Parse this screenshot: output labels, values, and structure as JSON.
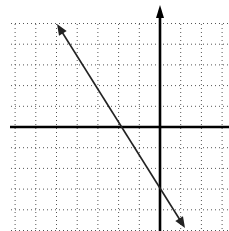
{
  "chart_data": {
    "type": "line",
    "title": "",
    "xlabel": "",
    "ylabel": "",
    "grid": true,
    "grid_style": "dotted",
    "xlim": [
      -7,
      3
    ],
    "ylim": [
      -5,
      5
    ],
    "grid_step": 1,
    "axes_arrows": {
      "y_positive": true,
      "x_positive": false
    },
    "series": [
      {
        "name": "line",
        "equation": "y = -1.5x - 3",
        "slope": -1.5,
        "intercept": -3,
        "x": [
          -5,
          -4,
          -2,
          0,
          1.2
        ],
        "y": [
          4.5,
          3,
          0,
          -3,
          -4.8
        ],
        "arrows": "both",
        "color": "#222222"
      }
    ]
  },
  "layout": {
    "origin_px": [
      160,
      127
    ],
    "unit_px": 20.7,
    "grid_extent_px": {
      "left": 11,
      "top": 24,
      "right": 229,
      "bottom": 231
    },
    "y_axis_top_px": 5,
    "line_endpoints_px": [
      [
        57,
        24
      ],
      [
        185,
        228
      ]
    ]
  }
}
